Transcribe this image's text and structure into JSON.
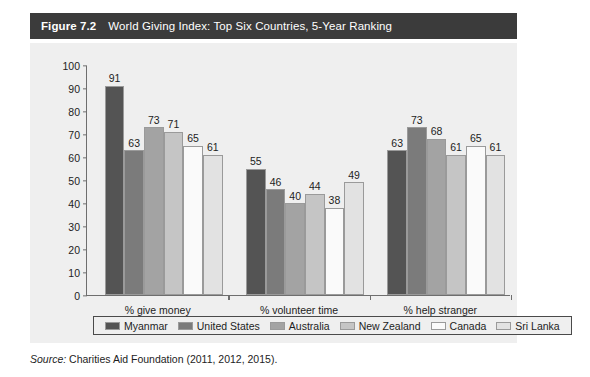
{
  "figure": {
    "number": "Figure 7.2",
    "title": "World Giving Index: Top Six Countries, 5-Year Ranking"
  },
  "source": {
    "label": "Source:",
    "text": "Charities Aid Foundation (2011, 2012, 2015)."
  },
  "chart_data": {
    "type": "bar",
    "title": "World Giving Index: Top Six Countries, 5-Year Ranking",
    "xlabel": "",
    "ylabel": "",
    "ylim": [
      0,
      100
    ],
    "ytick_step": 10,
    "yticks": [
      100,
      90,
      80,
      70,
      60,
      50,
      40,
      30,
      20,
      10,
      0
    ],
    "grid": false,
    "legend_position": "bottom",
    "categories": [
      "% give money",
      "% volunteer time",
      "% help stranger"
    ],
    "series": [
      {
        "name": "Myanmar",
        "color": "#545454",
        "values": [
          91,
          55,
          63
        ]
      },
      {
        "name": "United States",
        "color": "#7b7b7b",
        "values": [
          63,
          46,
          73
        ]
      },
      {
        "name": "Australia",
        "color": "#a3a3a3",
        "values": [
          73,
          40,
          68
        ]
      },
      {
        "name": "New Zealand",
        "color": "#c5c5c5",
        "values": [
          71,
          44,
          61
        ]
      },
      {
        "name": "Canada",
        "color": "#fafafa",
        "values": [
          65,
          38,
          65
        ]
      },
      {
        "name": "Sri Lanka",
        "color": "#e2e2e2",
        "values": [
          61,
          49,
          61
        ]
      }
    ]
  }
}
